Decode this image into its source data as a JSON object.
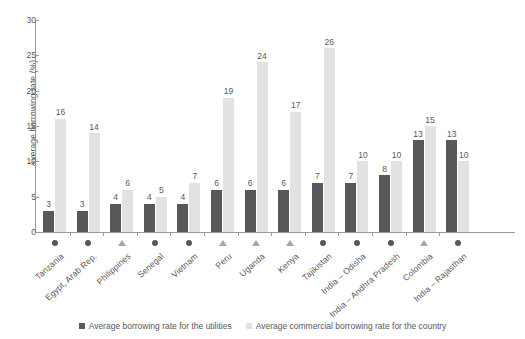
{
  "chart_data": {
    "type": "bar",
    "title": "",
    "xlabel": "",
    "ylabel": "Average borrowing rate (%)",
    "ylim": [
      0,
      30
    ],
    "yticks": [
      0,
      5,
      10,
      15,
      20,
      25,
      30
    ],
    "grid": false,
    "legend_position": "bottom",
    "categories": [
      "Tanzania",
      "Egypt, Arab Rep.",
      "Philippines",
      "Senegal",
      "Vietnam",
      "Peru",
      "Uganda",
      "Kenya",
      "Tajikistan",
      "India – Odisha",
      "India – Andhra Pradesh",
      "Colombia",
      "India – Rajasthan"
    ],
    "category_markers": [
      "circle",
      "circle",
      "triangle",
      "circle",
      "circle",
      "triangle",
      "triangle",
      "triangle",
      "circle",
      "circle",
      "circle",
      "triangle",
      "circle"
    ],
    "series": [
      {
        "name": "Average borrowing rate for the utilities",
        "color": "#58585a",
        "values": [
          3,
          3,
          4,
          4,
          4,
          6,
          6,
          6,
          7,
          7,
          8,
          13,
          13
        ]
      },
      {
        "name": "Average commercial borrowing rate for the country",
        "color": "#e2e2e2",
        "values": [
          16,
          14,
          6,
          5,
          7,
          19,
          24,
          17,
          26,
          10,
          10,
          15,
          10
        ]
      }
    ]
  },
  "legend": {
    "items": [
      {
        "label": "Average borrowing rate for the utilities",
        "color": "#58585a"
      },
      {
        "label": "Average commercial borrowing rate for the country",
        "color": "#e2e2e2"
      }
    ]
  }
}
